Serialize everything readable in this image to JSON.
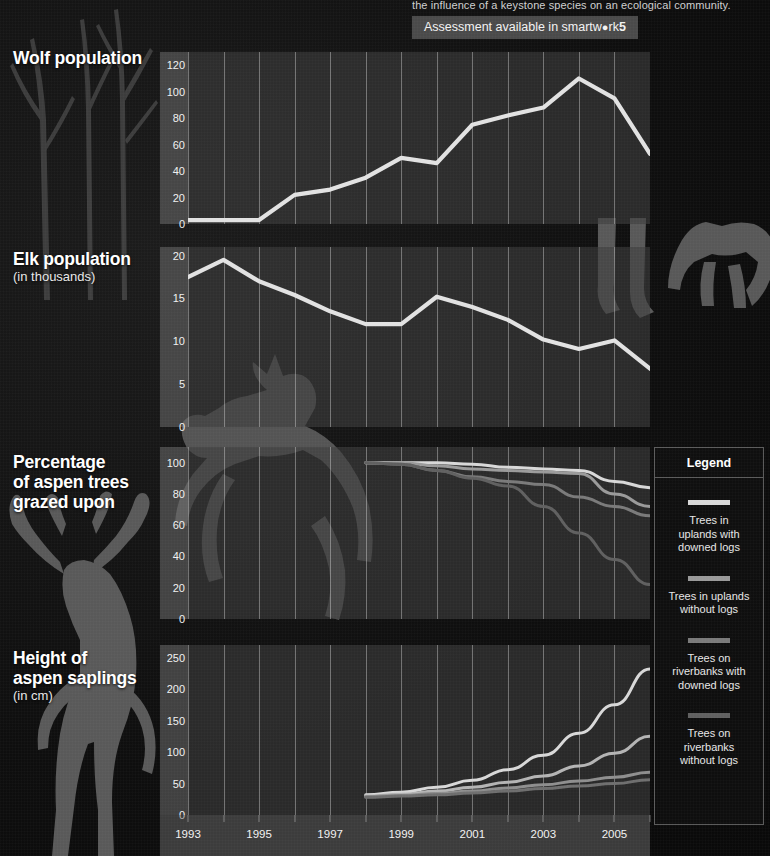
{
  "header": {
    "caption_cut": "the influence of a keystone species on an ecological community.",
    "pill_prefix": "Assessment available in smartw",
    "pill_dot": "●",
    "pill_mid": "rk",
    "pill_bold": "5"
  },
  "panels": {
    "wolf": {
      "title": "Wolf population",
      "subtitle": ""
    },
    "elk": {
      "title": "Elk population",
      "subtitle": "(in thousands)"
    },
    "aspen": {
      "title": "Percentage\nof aspen trees\ngrazed upon",
      "subtitle": ""
    },
    "sap": {
      "title": "Height of\naspen saplings",
      "subtitle": "(in cm)"
    }
  },
  "xaxis": {
    "labels": [
      "1993",
      "1995",
      "1997",
      "1999",
      "2001",
      "2003",
      "2005"
    ],
    "years": [
      1993,
      1994,
      1995,
      1996,
      1997,
      1998,
      1999,
      2000,
      2001,
      2002,
      2003,
      2004,
      2005,
      2006
    ]
  },
  "legend": {
    "title": "Legend",
    "items": [
      {
        "label": "Trees in\nuplands with\ndowned logs",
        "color": "#d8d8d8"
      },
      {
        "label": "Trees in uplands\nwithout logs",
        "color": "#9a9a9a"
      },
      {
        "label": "Trees on\nriverbanks with\ndowned logs",
        "color": "#7a7a7a"
      },
      {
        "label": "Trees on\nriverbanks\nwithout logs",
        "color": "#606060"
      }
    ]
  },
  "colors": {
    "line_primary": "#e2e2e2",
    "panel_bg": "#3e3e3e",
    "axis_bg": "#6c6c6c",
    "grid": "#e1e1e1",
    "background": "#101010",
    "silhouette": "#555555"
  },
  "chart_data": [
    {
      "id": "wolf",
      "type": "line",
      "title": "Wolf population",
      "xlabel": "",
      "ylabel": "",
      "ylim": [
        0,
        130
      ],
      "yticks": [
        0,
        20,
        40,
        60,
        80,
        100,
        120
      ],
      "grid": true,
      "x": [
        1993,
        1994,
        1995,
        1996,
        1997,
        1998,
        1999,
        2000,
        2001,
        2002,
        2003,
        2004,
        2005,
        2006
      ],
      "series": [
        {
          "name": "Wolf population",
          "color": "#e2e2e2",
          "values": [
            3,
            3,
            3,
            22,
            26,
            35,
            50,
            46,
            75,
            82,
            88,
            110,
            95,
            53
          ]
        }
      ]
    },
    {
      "id": "elk",
      "type": "line",
      "title": "Elk population (in thousands)",
      "xlabel": "",
      "ylabel": "in thousands",
      "ylim": [
        0,
        21
      ],
      "yticks": [
        0,
        5,
        10,
        15,
        20
      ],
      "grid": true,
      "x": [
        1993,
        1994,
        1995,
        1996,
        1997,
        1998,
        1999,
        2000,
        2001,
        2002,
        2003,
        2004,
        2005,
        2006
      ],
      "series": [
        {
          "name": "Elk population",
          "color": "#e2e2e2",
          "values": [
            17.5,
            19.5,
            17.0,
            15.4,
            13.5,
            12.0,
            12.0,
            15.2,
            14.0,
            12.5,
            10.2,
            9.1,
            10.1,
            6.8
          ]
        }
      ]
    },
    {
      "id": "aspen",
      "type": "line",
      "title": "Percentage of aspen trees grazed upon",
      "xlabel": "",
      "ylabel": "percent",
      "ylim": [
        0,
        110
      ],
      "yticks": [
        0,
        20,
        40,
        60,
        80,
        100
      ],
      "grid": true,
      "x": [
        1998,
        1999,
        2000,
        2001,
        2002,
        2003,
        2004,
        2005,
        2006
      ],
      "series": [
        {
          "name": "Trees in uplands with downed logs",
          "color": "#d8d8d8",
          "values": [
            100,
            100,
            100,
            99,
            97,
            96,
            95,
            88,
            84
          ]
        },
        {
          "name": "Trees in uplands without logs",
          "color": "#9a9a9a",
          "values": [
            100,
            100,
            98,
            96,
            95,
            94,
            93,
            80,
            72
          ]
        },
        {
          "name": "Trees on riverbanks with downed logs",
          "color": "#7a7a7a",
          "values": [
            100,
            99,
            95,
            91,
            88,
            86,
            78,
            72,
            66
          ]
        },
        {
          "name": "Trees on riverbanks without logs",
          "color": "#606060",
          "values": [
            100,
            99,
            95,
            90,
            85,
            72,
            55,
            38,
            22
          ]
        }
      ]
    },
    {
      "id": "sap",
      "type": "line",
      "title": "Height of aspen saplings (in cm)",
      "xlabel": "",
      "ylabel": "cm",
      "ylim": [
        0,
        270
      ],
      "yticks": [
        0,
        50,
        100,
        150,
        200,
        250
      ],
      "grid": true,
      "x": [
        1998,
        1999,
        2000,
        2001,
        2002,
        2003,
        2004,
        2005,
        2006
      ],
      "series": [
        {
          "name": "Trees on riverbanks without logs",
          "color": "#d8d8d8",
          "values": [
            32,
            36,
            44,
            55,
            72,
            95,
            130,
            175,
            232
          ]
        },
        {
          "name": "Trees on riverbanks with downed logs",
          "color": "#b4b4b4",
          "values": [
            30,
            33,
            38,
            44,
            52,
            62,
            78,
            98,
            125
          ]
        },
        {
          "name": "Trees in uplands without logs",
          "color": "#8e8e8e",
          "values": [
            29,
            31,
            34,
            38,
            43,
            48,
            54,
            60,
            68
          ]
        },
        {
          "name": "Trees in uplands with downed logs",
          "color": "#6e6e6e",
          "values": [
            28,
            30,
            32,
            35,
            38,
            42,
            46,
            50,
            56
          ]
        }
      ]
    }
  ]
}
